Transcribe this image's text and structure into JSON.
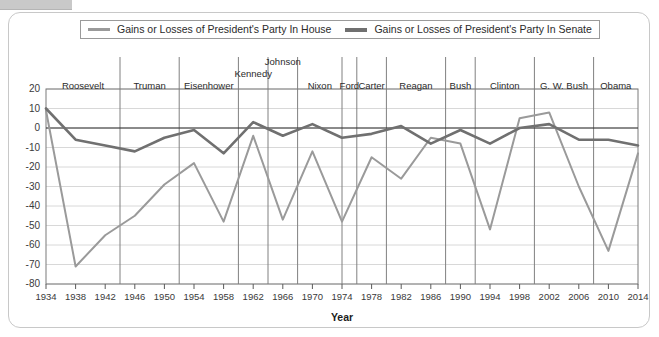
{
  "legend": {
    "entries": [
      {
        "label": "Gains or Losses of President's Party In House",
        "color": "#9a9a9a"
      },
      {
        "label": "Gains or Losses of President's Party In Senate",
        "color": "#707070"
      }
    ]
  },
  "axis": {
    "x_title": "Year",
    "y_ticks": [
      "20",
      "10",
      "0",
      "-10",
      "-20",
      "-30",
      "-40",
      "-50",
      "-60",
      "-70",
      "-80"
    ],
    "x_ticks": [
      "1934",
      "1938",
      "1942",
      "1946",
      "1950",
      "1954",
      "1958",
      "1962",
      "1966",
      "1970",
      "1974",
      "1978",
      "1982",
      "1986",
      "1990",
      "1994",
      "1998",
      "2002",
      "2006",
      "2010",
      "2014"
    ]
  },
  "presidents": [
    {
      "name": "Roosevelt",
      "start": 1934,
      "end": 1944
    },
    {
      "name": "Truman",
      "start": 1944,
      "end": 1952
    },
    {
      "name": "Eisenhower",
      "start": 1952,
      "end": 1960
    },
    {
      "name": "Kennedy",
      "start": 1960,
      "end": 1964
    },
    {
      "name": "Johnson",
      "start": 1964,
      "end": 1968
    },
    {
      "name": "Nixon",
      "start": 1968,
      "end": 1974
    },
    {
      "name": "Ford",
      "start": 1974,
      "end": 1976
    },
    {
      "name": "Carter",
      "start": 1976,
      "end": 1980
    },
    {
      "name": "Reagan",
      "start": 1980,
      "end": 1988
    },
    {
      "name": "Bush",
      "start": 1988,
      "end": 1992
    },
    {
      "name": "Clinton",
      "start": 1992,
      "end": 2000
    },
    {
      "name": "G. W. Bush",
      "start": 2000,
      "end": 2008
    },
    {
      "name": "Obama",
      "start": 2008,
      "end": 2016
    }
  ],
  "chart_data": {
    "type": "line",
    "title": "",
    "xlabel": "Year",
    "ylabel": "",
    "xlim": [
      1934,
      2014
    ],
    "ylim": [
      -80,
      20
    ],
    "grid": true,
    "legend_position": "top",
    "x": [
      1934,
      1938,
      1942,
      1946,
      1950,
      1954,
      1958,
      1962,
      1966,
      1970,
      1974,
      1978,
      1982,
      1986,
      1990,
      1994,
      1998,
      2002,
      2006,
      2010,
      2014
    ],
    "series": [
      {
        "name": "Gains or Losses of President's Party In House",
        "color": "#9a9a9a",
        "values": [
          9,
          -71,
          -55,
          -45,
          -29,
          -18,
          -48,
          -4,
          -47,
          -12,
          -48,
          -15,
          -26,
          -5,
          -8,
          -52,
          5,
          8,
          -30,
          -63,
          -13
        ]
      },
      {
        "name": "Gains or Losses of President's Party In Senate",
        "color": "#707070",
        "values": [
          10,
          -6,
          -9,
          -12,
          -5,
          -1,
          -13,
          3,
          -4,
          2,
          -5,
          -3,
          1,
          -8,
          -1,
          -8,
          0,
          2,
          -6,
          -6,
          -9
        ]
      }
    ]
  }
}
